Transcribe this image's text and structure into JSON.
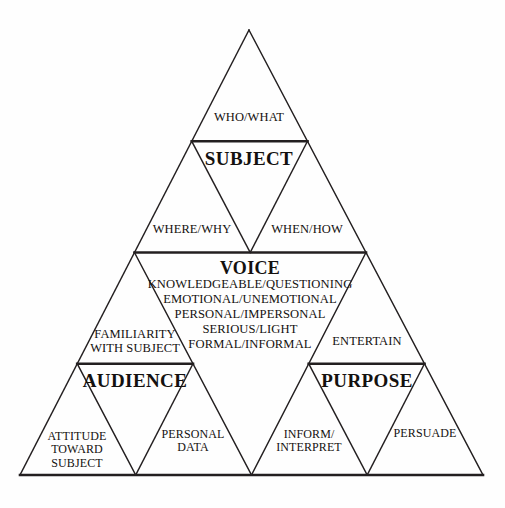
{
  "diagram": {
    "type": "nested-triangle",
    "stroke_color": "#231f20",
    "background_color": "#fefefe",
    "text_color": "#14110f",
    "thin_stroke_width": 1.4,
    "thick_stroke_width": 2.6,
    "geometry": {
      "apex": [
        249,
        30
      ],
      "bottom_left": [
        20,
        475
      ],
      "bottom_right": [
        483,
        475
      ]
    },
    "levels": 4
  },
  "labels": {
    "subject": "SUBJECT",
    "voice": "VOICE",
    "audience": "AUDIENCE",
    "purpose": "PURPOSE",
    "who_what": "WHO/WHAT",
    "where_why": "WHERE/WHY",
    "when_how": "WHEN/HOW",
    "familiarity_with_subject": "FAMILIARITY\nWITH SUBJECT",
    "entertain": "ENTERTAIN",
    "attitude_toward_subject": "ATTITUDE\nTOWARD\nSUBJECT",
    "personal_data": "PERSONAL\nDATA",
    "inform_interpret": "INFORM/\nINTERPRET",
    "persuade": "PERSUADE",
    "voice_attributes": "KNOWLEDGEABLE/QUESTIONING\nEMOTIONAL/UNEMOTIONAL\nPERSONAL/IMPERSONAL\nSERIOUS/LIGHT\nFORMAL/INFORMAL"
  },
  "voice_attribute_list": [
    "KNOWLEDGEABLE/QUESTIONING",
    "EMOTIONAL/UNEMOTIONAL",
    "PERSONAL/IMPERSONAL",
    "SERIOUS/LIGHT",
    "FORMAL/INFORMAL"
  ]
}
